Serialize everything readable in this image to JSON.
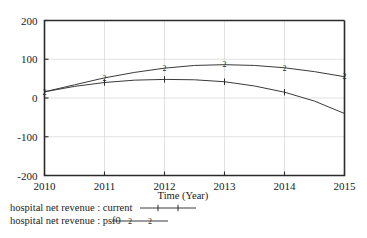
{
  "chart_data": {
    "type": "line",
    "title": "",
    "xlabel": "Time (Year)",
    "ylabel": "",
    "xlim": [
      2010,
      2015
    ],
    "ylim": [
      -200,
      200
    ],
    "xticks": [
      "2010",
      "2011",
      "2012",
      "2013",
      "2014",
      "2015"
    ],
    "yticks": [
      "200",
      "100",
      "0",
      "-100",
      "-200"
    ],
    "grid": true,
    "legend_position": "below-left",
    "x": [
      2010,
      2010.5,
      2011,
      2011.5,
      2012,
      2012.5,
      2013,
      2013.5,
      2014,
      2014.5,
      2015
    ],
    "series": [
      {
        "name": "hospital net revenue : current",
        "marker": "1",
        "values": [
          16,
          30,
          40,
          46,
          48,
          47,
          42,
          31,
          15,
          -8,
          -40
        ]
      },
      {
        "name": "hospital net revenue : psf0",
        "marker": "2",
        "values": [
          16,
          34,
          52,
          66,
          77,
          84,
          86,
          84,
          78,
          68,
          55
        ]
      }
    ]
  },
  "axis": {
    "x_title": "Time (Year)",
    "y_title": ""
  },
  "legend": {
    "entries": [
      {
        "label": "hospital net revenue : current",
        "marker": "1"
      },
      {
        "label": "hospital net revenue : psf0",
        "marker": "2"
      }
    ]
  },
  "colors": {
    "line": "#3a3a3a",
    "axis": "#2b2b2b",
    "grid": "#cfcfcf",
    "background": "#ffffff"
  }
}
